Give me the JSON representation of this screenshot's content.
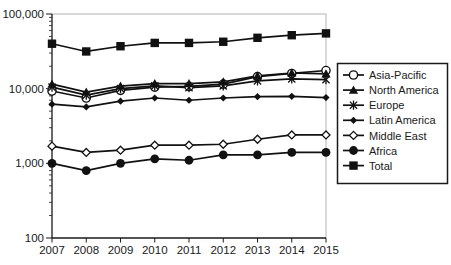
{
  "chart_data": {
    "type": "line",
    "title": "",
    "xlabel": "",
    "ylabel": "",
    "scale_y": "log",
    "ylim": [
      100,
      100000
    ],
    "grid": false,
    "legend_position": "right",
    "x_labels": [
      "2007",
      "2008",
      "2009",
      "2010",
      "2011",
      "2012",
      "2013",
      "2014",
      "2015"
    ],
    "y_ticks": {
      "values": [
        100,
        1000,
        10000,
        100000
      ],
      "labels": [
        "100",
        "1,000",
        "10,000",
        "100,000"
      ]
    },
    "series": [
      {
        "name": "Asia-Pacific",
        "marker": "circle-open",
        "values": [
          9300,
          7500,
          9500,
          10500,
          10700,
          11500,
          14500,
          16000,
          17500
        ]
      },
      {
        "name": "North America",
        "marker": "triangle-filled",
        "values": [
          11500,
          9000,
          10800,
          11700,
          11700,
          12300,
          14800,
          16200,
          15800
        ]
      },
      {
        "name": "Europe",
        "marker": "asterisk",
        "values": [
          10500,
          8200,
          10000,
          10900,
          10300,
          10900,
          12700,
          13500,
          13200
        ]
      },
      {
        "name": "Latin America",
        "marker": "diamond-filled",
        "values": [
          6200,
          5700,
          6800,
          7500,
          7000,
          7500,
          7800,
          7900,
          7600
        ]
      },
      {
        "name": "Middle East",
        "marker": "diamond-open",
        "values": [
          1700,
          1400,
          1500,
          1750,
          1750,
          1800,
          2100,
          2400,
          2400
        ]
      },
      {
        "name": "Africa",
        "marker": "circle-filled",
        "values": [
          1000,
          800,
          1000,
          1150,
          1100,
          1300,
          1300,
          1400,
          1400
        ]
      },
      {
        "name": "Total",
        "marker": "square-filled",
        "values": [
          40000,
          31500,
          37000,
          41000,
          41000,
          42500,
          48000,
          52000,
          55000
        ]
      }
    ],
    "colors": {
      "series_line": "#111111",
      "axis": "#1a1a1a",
      "text": "#1a1a1a",
      "plot_border": "#b3b3b3",
      "background": "#ffffff",
      "legend_border": "#1a1a1a"
    }
  }
}
